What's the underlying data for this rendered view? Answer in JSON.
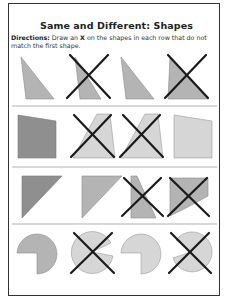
{
  "worksheet": {
    "title": "Same and Different: Shapes",
    "directions_label": "Directions:",
    "directions_text_1": "Draw an",
    "directions_mark": "X",
    "directions_text_2": "on the shapes in each row that do not match the first shape.",
    "colors": {
      "dark_fill": "#8f8f8f",
      "mid_fill": "#b4b4b4",
      "light_fill": "#d6d6d6",
      "shape_stroke": "#888888",
      "x_mark": "#1a1a1a",
      "divider": "#b0b0b0"
    },
    "rows": [
      {
        "name": "triangles",
        "shapes": [
          {
            "kind": "right-triangle",
            "match": true,
            "crossed": false
          },
          {
            "kind": "thin-triangle",
            "match": false,
            "crossed": true
          },
          {
            "kind": "right-triangle",
            "match": true,
            "crossed": false
          },
          {
            "kind": "wide-triangle",
            "match": false,
            "crossed": true
          }
        ]
      },
      {
        "name": "quadrilaterals",
        "shapes": [
          {
            "kind": "slanted-quad",
            "match": true,
            "crossed": false
          },
          {
            "kind": "trapezoid",
            "match": false,
            "crossed": true
          },
          {
            "kind": "trapezoid",
            "match": false,
            "crossed": true
          },
          {
            "kind": "slanted-quad",
            "match": true,
            "crossed": false
          }
        ]
      },
      {
        "name": "corner-triangles",
        "shapes": [
          {
            "kind": "corner-triangle",
            "match": true,
            "crossed": false
          },
          {
            "kind": "corner-triangle",
            "match": true,
            "crossed": false
          },
          {
            "kind": "narrow-quad",
            "match": false,
            "crossed": true
          },
          {
            "kind": "pentagon",
            "match": false,
            "crossed": true
          }
        ]
      },
      {
        "name": "circles",
        "shapes": [
          {
            "kind": "pac-circle-quarter",
            "match": true,
            "crossed": false
          },
          {
            "kind": "pac-circle-wedge",
            "match": false,
            "crossed": true
          },
          {
            "kind": "pac-circle-quarter",
            "match": true,
            "crossed": false
          },
          {
            "kind": "pac-circle-wedge-left",
            "match": false,
            "crossed": true
          }
        ]
      }
    ]
  }
}
